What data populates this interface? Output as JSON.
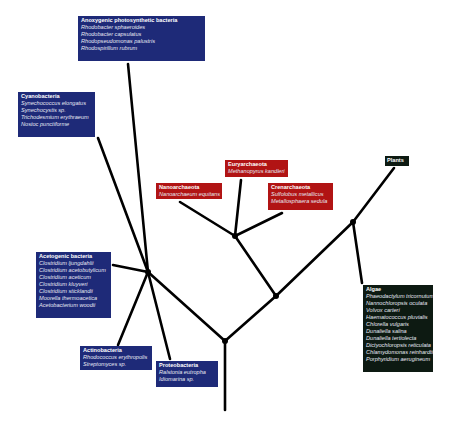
{
  "colors": {
    "bacteria": "#1e2a78",
    "archaea": "#b11414",
    "eukarya": "#0d1a12",
    "branch": "#000000"
  },
  "groups": {
    "anoxygenic": {
      "title": "Anoxygenic photosynthetic bacteria",
      "species": [
        "Rhodobacter sphaeroides",
        "Rhodobacter capsulatus",
        "Rhodopseudomonas palustris",
        "Rhodospirillum rubrum"
      ]
    },
    "cyanobacteria": {
      "title": "Cyanobacteria",
      "species": [
        "Synechococcus elongatus",
        "Synechocystis sp.",
        "Trichodesmium erythraeum",
        "Nostoc punctiforme"
      ]
    },
    "euryarchaeota": {
      "title": "Euryarchaeota",
      "species": [
        "Methanopyrus kandleri"
      ]
    },
    "nanoarchaeota": {
      "title": "Nanoarchaeota",
      "species": [
        "Nanoarchaeum equitans"
      ]
    },
    "crenarchaeota": {
      "title": "Crenarchaeota",
      "species": [
        "Sulfolobus metallicus",
        "Metallosphaera sedula"
      ]
    },
    "plants": {
      "title": "Plants",
      "species": []
    },
    "acetogenic": {
      "title": "Acetogenic bacteria",
      "species": [
        "Clostridium ljungdahlii",
        "Clostridium acetobutylicum",
        "Clostridium aceticum",
        "Clostridium kluyveri",
        "Clostridium sticklandii",
        "Moorella thermoacetica",
        "Acetobacterium woodii"
      ]
    },
    "actinobacteria": {
      "title": "Actinobacteria",
      "species": [
        "Rhodococcus erythropolis",
        "Streptomyces sp."
      ]
    },
    "proteobacteria": {
      "title": "Proteobacteria",
      "species": [
        "Ralstonia eutropha",
        "Idiomarina sp."
      ]
    },
    "algae": {
      "title": "Algae",
      "species": [
        "Phaeodactylum tricornutum",
        "Nannochloropsis oculata",
        "Volvox carteri",
        "Haematococcus pluvialis",
        "Chlorella vulgaris",
        "Dunaliella salina",
        "Dunaliella tertiolecta",
        "Dictyochloropsis reticulata",
        "Chlamydomonas reinhardtii",
        "Porphyridium aerugineum"
      ]
    }
  }
}
